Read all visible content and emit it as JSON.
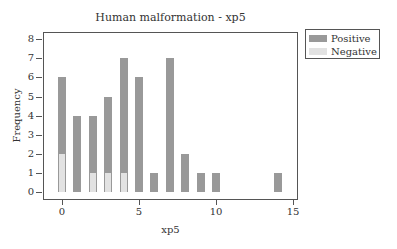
{
  "chart_data": {
    "type": "bar",
    "title": "Human malformation - xp5",
    "xlabel": "xp5",
    "ylabel": "Frequency",
    "x": [
      0,
      1,
      2,
      3,
      4,
      5,
      6,
      7,
      8,
      9,
      10,
      14
    ],
    "series": [
      {
        "name": "Positive",
        "color": "#999999",
        "values": [
          6,
          4,
          4,
          5,
          7,
          6,
          1,
          7,
          2,
          1,
          1,
          1
        ]
      },
      {
        "name": "Negative",
        "color": "#e2e2e2",
        "values": [
          2,
          0,
          1,
          1,
          1,
          0,
          0,
          0,
          0,
          0,
          0,
          0
        ]
      }
    ],
    "xlim": [
      -1,
      15
    ],
    "ylim": [
      0,
      8
    ],
    "xticks": [
      0,
      5,
      10,
      15
    ],
    "yticks": [
      0,
      1,
      2,
      3,
      4,
      5,
      6,
      7,
      8
    ],
    "grid": false,
    "legend_position": "outside-right-top"
  },
  "labels": {
    "title": "Human malformation - xp5",
    "xlabel": "xp5",
    "ylabel": "Frequency",
    "legend": [
      "Positive",
      "Negative"
    ],
    "xticks": [
      "0",
      "5",
      "10",
      "15"
    ],
    "yticks": [
      "0",
      "1",
      "2",
      "3",
      "4",
      "5",
      "6",
      "7",
      "8"
    ]
  }
}
